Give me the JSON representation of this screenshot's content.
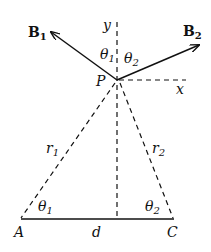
{
  "diagram": {
    "title": "",
    "point_P": {
      "label": "P",
      "x": 117,
      "y": 80
    },
    "point_A": {
      "label": "A",
      "x": 21,
      "y": 219
    },
    "point_C": {
      "label": "C",
      "x": 173,
      "y": 219
    },
    "vectors": [
      {
        "name": "B",
        "subscript": "1",
        "from": [
          117,
          80
        ],
        "to": [
          50,
          32
        ]
      },
      {
        "name": "B",
        "subscript": "2",
        "from": [
          117,
          80
        ],
        "to": [
          200,
          45
        ]
      }
    ],
    "axes": {
      "y_label": "y",
      "x_label": "x"
    },
    "angles_at_P": [
      {
        "sym": "θ",
        "sub": "1"
      },
      {
        "sym": "θ",
        "sub": "2"
      }
    ],
    "angles_at_base": [
      {
        "sym": "θ",
        "sub": "1"
      },
      {
        "sym": "θ",
        "sub": "2"
      }
    ],
    "distances": [
      {
        "sym": "r",
        "sub": "1"
      },
      {
        "sym": "r",
        "sub": "2"
      },
      {
        "sym": "d",
        "sub": ""
      }
    ],
    "colors": {
      "ink": "#111111",
      "background": "#ffffff"
    }
  }
}
